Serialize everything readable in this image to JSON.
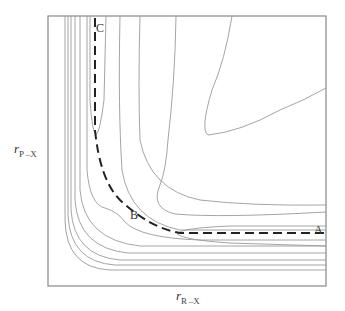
{
  "diagram": {
    "type": "potential-energy-surface-contour",
    "y_axis": {
      "symbol": "r",
      "subscript": "P –X"
    },
    "x_axis": {
      "symbol": "r",
      "subscript": "R –X"
    },
    "points": [
      {
        "id": "A",
        "label": "A"
      },
      {
        "id": "B",
        "label": "B"
      },
      {
        "id": "C",
        "label": "C"
      }
    ],
    "reaction_path": {
      "style": "dashed",
      "from": "C",
      "via": "B",
      "to": "A"
    },
    "colors": {
      "frame": "#888888",
      "contour": "#9a9a9a",
      "path": "#222222",
      "text": "#333333"
    }
  }
}
